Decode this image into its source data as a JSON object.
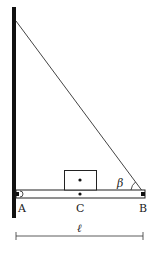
{
  "diagram": {
    "labels": {
      "point_a": "A",
      "point_c": "C",
      "point_b": "B",
      "angle": "β",
      "length": "ℓ"
    },
    "colors": {
      "ink": "#1a1a1a",
      "wall": "#111111",
      "rope": "#444444",
      "background": "#ffffff"
    }
  }
}
